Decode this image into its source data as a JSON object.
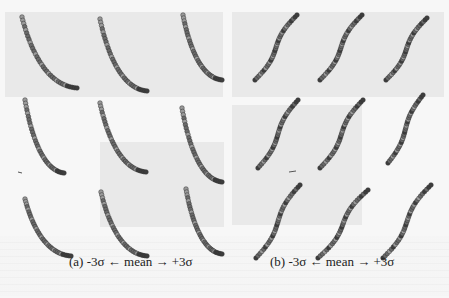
{
  "figure": {
    "panels": [
      {
        "id": "a",
        "caption": "(a) -3σ ← mean → +3σ",
        "layout": "3x3 grid",
        "curve_direction": "descending (top-left to bottom-right)",
        "cells": [
          {
            "x0": 22,
            "y0": 17,
            "x1": 77,
            "y1": 88
          },
          {
            "x0": 100,
            "y0": 19,
            "x1": 147,
            "y1": 91
          },
          {
            "x0": 183,
            "y0": 15,
            "x1": 222,
            "y1": 80
          },
          {
            "x0": 25,
            "y0": 100,
            "x1": 64,
            "y1": 173
          },
          {
            "x0": 100,
            "y0": 103,
            "x1": 146,
            "y1": 172
          },
          {
            "x0": 182,
            "y0": 108,
            "x1": 222,
            "y1": 182
          },
          {
            "x0": 25,
            "y0": 199,
            "x1": 71,
            "y1": 256
          },
          {
            "x0": 101,
            "y0": 192,
            "x1": 147,
            "y1": 256
          },
          {
            "x0": 186,
            "y0": 189,
            "x1": 222,
            "y1": 254
          }
        ]
      },
      {
        "id": "b",
        "caption": "(b) -3σ ← mean → +3σ",
        "layout": "3x3 grid",
        "curve_direction": "ascending (bottom-left to top-right)",
        "cells": [
          {
            "x0": 255,
            "y0": 80,
            "x1": 297,
            "y1": 15
          },
          {
            "x0": 320,
            "y0": 80,
            "x1": 362,
            "y1": 15
          },
          {
            "x0": 386,
            "y0": 80,
            "x1": 427,
            "y1": 18
          },
          {
            "x0": 258,
            "y0": 168,
            "x1": 298,
            "y1": 100
          },
          {
            "x0": 320,
            "y0": 168,
            "x1": 363,
            "y1": 100
          },
          {
            "x0": 388,
            "y0": 163,
            "x1": 423,
            "y1": 95
          },
          {
            "x0": 256,
            "y0": 258,
            "x1": 300,
            "y1": 185
          },
          {
            "x0": 318,
            "y0": 258,
            "x1": 368,
            "y1": 190
          },
          {
            "x0": 383,
            "y0": 258,
            "x1": 431,
            "y1": 185
          }
        ]
      }
    ],
    "colors": {
      "point_dark": "#3d3d3d",
      "point_mid": "#6a6a6a",
      "point_light": "#9a9a9a",
      "background": "#f7f7f7"
    }
  }
}
